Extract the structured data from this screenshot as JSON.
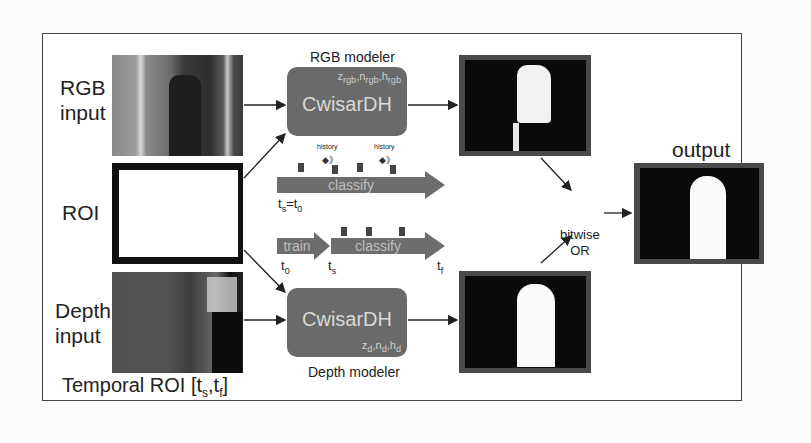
{
  "figure": {
    "inputs": {
      "rgb_label": "RGB input",
      "rgb_label_line1": "RGB",
      "rgb_label_line2": "input",
      "roi_label": "ROI",
      "depth_label_line1": "Depth",
      "depth_label_line2": "input",
      "temporal_roi_label": "Temporal ROI [t",
      "temporal_roi_sub_s": "s",
      "temporal_roi_sep": ",t",
      "temporal_roi_sub_f": "f",
      "temporal_roi_close": "]"
    },
    "rgb_modeler": {
      "title": "RGB modeler",
      "name": "CwisarDH",
      "params": "z_rgb, n_rgb, h_rgb",
      "params_z": "z",
      "params_z_sub": "rgb",
      "params_n": ",n",
      "params_n_sub": "rgb",
      "params_h": ",h",
      "params_h_sub": "rgb"
    },
    "depth_modeler": {
      "title": "Depth modeler",
      "name": "CwisarDH",
      "params_z": "z",
      "params_z_sub": "d",
      "params_n": ",n",
      "params_n_sub": "d",
      "params_h": ",h",
      "params_h_sub": "d"
    },
    "timeline_top": {
      "bar_label": "classify",
      "history_labels": [
        "history",
        "history"
      ],
      "start_label": "t",
      "start_sub": "s",
      "start_eq": "=t",
      "start_eq_sub": "0"
    },
    "timeline_bottom": {
      "train_label": "train",
      "classify_label": "classify",
      "t0": "t",
      "t0_sub": "0",
      "ts": "t",
      "ts_sub": "s",
      "tf": "t",
      "tf_sub": "f"
    },
    "combine": {
      "line1": "bitwise",
      "line2": "OR"
    },
    "output": {
      "label": "output"
    },
    "colors": {
      "modeler_fill": "#6a6a6a",
      "bar_fill": "#6d6d6d",
      "frame_border": "#444444",
      "mask_border": "#4a4a4a"
    }
  }
}
